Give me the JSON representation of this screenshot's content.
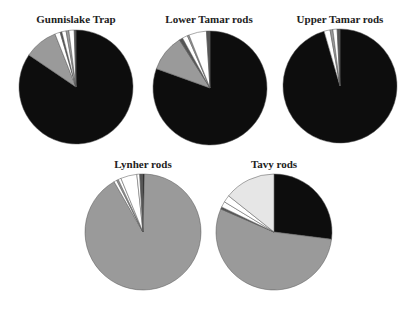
{
  "colors": {
    "black": "#0d0d0d",
    "grey": "#9a9a9a",
    "white": "#ffffff",
    "dark_grey": "#555555",
    "light_dotted": "#e6e6e6",
    "stroke": "#555555"
  },
  "chart_data": [
    {
      "type": "pie",
      "title": "Gunnislake Trap",
      "center": [
        76,
        87
      ],
      "radius": 57,
      "slices": [
        {
          "color": "black",
          "value": 84.5
        },
        {
          "color": "grey",
          "value": 9.5
        },
        {
          "color": "white",
          "value": 1.5
        },
        {
          "color": "dark_grey",
          "value": 0.5
        },
        {
          "color": "white",
          "value": 1.2
        },
        {
          "color": "grey",
          "value": 0.8
        },
        {
          "color": "white",
          "value": 1.5
        },
        {
          "color": "dark_grey",
          "value": 0.5
        }
      ]
    },
    {
      "type": "pie",
      "title": "Lower Tamar rods",
      "center": [
        210,
        88
      ],
      "radius": 57,
      "slices": [
        {
          "color": "black",
          "value": 80.5
        },
        {
          "color": "grey",
          "value": 10.5
        },
        {
          "color": "dark_grey",
          "value": 1.0
        },
        {
          "color": "white",
          "value": 1.5
        },
        {
          "color": "grey",
          "value": 0.5
        },
        {
          "color": "white",
          "value": 5.0
        },
        {
          "color": "dark_grey",
          "value": 1.0
        }
      ]
    },
    {
      "type": "pie",
      "title": "Upper Tamar rods",
      "center": [
        340,
        86
      ],
      "radius": 57,
      "slices": [
        {
          "color": "black",
          "value": 95.5
        },
        {
          "color": "white",
          "value": 1.7
        },
        {
          "color": "grey",
          "value": 0.8
        },
        {
          "color": "white",
          "value": 1.2
        },
        {
          "color": "dark_grey",
          "value": 0.8
        }
      ]
    },
    {
      "type": "pie",
      "title": "Lynher rods",
      "center": [
        143,
        232
      ],
      "radius": 58,
      "slices": [
        {
          "color": "black",
          "value": 0.4
        },
        {
          "color": "grey",
          "value": 91.3
        },
        {
          "color": "white",
          "value": 0.8
        },
        {
          "color": "grey",
          "value": 0.5
        },
        {
          "color": "white",
          "value": 0.8
        },
        {
          "color": "white",
          "value": 4.5
        },
        {
          "color": "white",
          "value": 0.8
        },
        {
          "color": "dark_grey",
          "value": 0.9
        }
      ]
    },
    {
      "type": "pie",
      "title": "Tavy rods",
      "center": [
        274,
        232
      ],
      "radius": 58,
      "slices": [
        {
          "color": "black",
          "value": 27.0
        },
        {
          "color": "grey",
          "value": 54.5
        },
        {
          "color": "dark_grey",
          "value": 0.6
        },
        {
          "color": "white",
          "value": 1.6
        },
        {
          "color": "white",
          "value": 2.0
        },
        {
          "color": "light_dotted",
          "value": 14.3
        }
      ]
    }
  ]
}
